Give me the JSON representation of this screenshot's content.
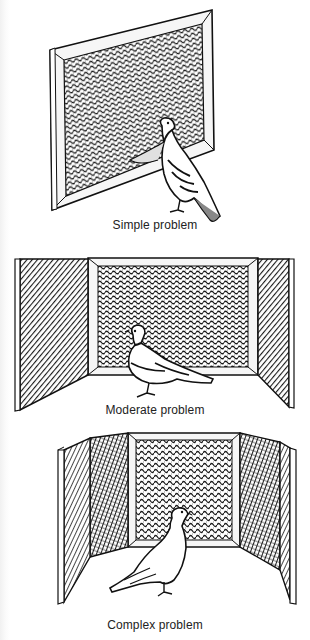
{
  "figure": {
    "panels": [
      {
        "id": "simple",
        "caption": "Simple problem",
        "walls": 1,
        "description": "Single framed mesh screen with pigeon in front"
      },
      {
        "id": "moderate",
        "caption": "Moderate problem",
        "walls": 3,
        "description": "Mesh back wall with two hatched side walls; pigeon inside"
      },
      {
        "id": "complex",
        "caption": "Complex problem",
        "walls": 5,
        "description": "Mesh back wall with four hatched side walls; pigeon inside"
      }
    ],
    "colors": {
      "ink": "#111111",
      "paper": "#ffffff",
      "frame": "#f4f4f4"
    }
  }
}
